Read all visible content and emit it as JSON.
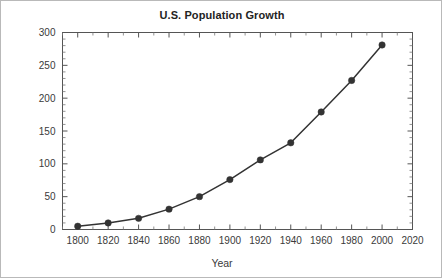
{
  "chart_data": {
    "type": "line",
    "title": "U.S. Population Growth",
    "xlabel": "Year",
    "ylabel": "Millions of People",
    "x": [
      1800,
      1820,
      1840,
      1860,
      1880,
      1900,
      1920,
      1940,
      1960,
      1980,
      2000
    ],
    "values": [
      5,
      10,
      17,
      31,
      50,
      76,
      106,
      132,
      179,
      227,
      281
    ],
    "series": [
      {
        "name": "U.S. Population",
        "values": [
          5,
          10,
          17,
          31,
          50,
          76,
          106,
          132,
          179,
          227,
          281
        ]
      }
    ],
    "xlim": [
      1790,
      2020
    ],
    "ylim": [
      0,
      300
    ],
    "x_ticks": [
      1800,
      1820,
      1840,
      1860,
      1880,
      1900,
      1920,
      1940,
      1960,
      1980,
      2000,
      2020
    ],
    "x_tick_labels": [
      "1800",
      "1820",
      "1840",
      "1860",
      "1880",
      "1900",
      "1920",
      "1940",
      "1960",
      "1980",
      "2000",
      "2020"
    ],
    "y_ticks": [
      0,
      50,
      100,
      150,
      200,
      250,
      300
    ],
    "y_tick_labels": [
      "0",
      "50",
      "100",
      "150",
      "200",
      "250",
      "300"
    ],
    "y_minor_step": 10,
    "x_minor_step": 10,
    "grid": false,
    "legend": false,
    "legend_position": "none",
    "marker": "circle",
    "line_color": "#333333",
    "marker_color": "#333333",
    "axis_color": "#555555",
    "background_color": "#ffffff"
  }
}
